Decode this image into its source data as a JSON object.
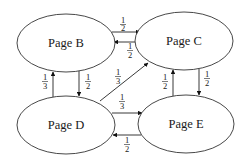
{
  "diagram": {
    "type": "directed-graph",
    "nodes": [
      {
        "id": "B",
        "label": "Page B",
        "cx": 66,
        "cy": 43,
        "rx": 49,
        "ry": 29
      },
      {
        "id": "C",
        "label": "Page C",
        "cx": 184,
        "cy": 41,
        "rx": 49,
        "ry": 29
      },
      {
        "id": "D",
        "label": "Page D",
        "cx": 66,
        "cy": 125,
        "rx": 49,
        "ry": 29
      },
      {
        "id": "E",
        "label": "Page E",
        "cx": 186,
        "cy": 124,
        "rx": 48,
        "ry": 29
      }
    ],
    "edges": [
      {
        "from": "B",
        "to": "C",
        "num": "1",
        "den": "2"
      },
      {
        "from": "C",
        "to": "B",
        "num": "1",
        "den": "2"
      },
      {
        "from": "D",
        "to": "B",
        "num": "1",
        "den": "3"
      },
      {
        "from": "B",
        "to": "D",
        "num": "1",
        "den": "2"
      },
      {
        "from": "D",
        "to": "C",
        "num": "1",
        "den": "3"
      },
      {
        "from": "D",
        "to": "E",
        "num": "1",
        "den": "3"
      },
      {
        "from": "E",
        "to": "D",
        "num": "1",
        "den": "2"
      },
      {
        "from": "E",
        "to": "C",
        "num": "1",
        "den": "2"
      },
      {
        "from": "C",
        "to": "E",
        "num": "1",
        "den": "2"
      }
    ]
  }
}
